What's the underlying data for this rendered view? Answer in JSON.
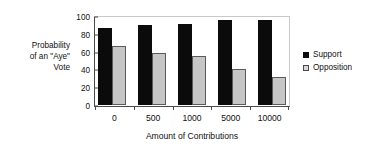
{
  "chart_data": {
    "type": "bar",
    "title": "",
    "categories": [
      "0",
      "500",
      "1000",
      "5000",
      "10000"
    ],
    "series": [
      {
        "name": "Support",
        "values": [
          87,
          90,
          91,
          95,
          96
        ],
        "color": "#0b0b0b"
      },
      {
        "name": "Opposition",
        "values": [
          66,
          59,
          55,
          41,
          31
        ],
        "color": "#c6c6c6"
      }
    ],
    "xlabel": "Amount of Contributions",
    "ylabel": "Probability of an \"Aye\" Vote",
    "ylabel_lines": [
      "Probability",
      "of an \"Aye\"",
      "Vote"
    ],
    "ylim": [
      0,
      100
    ],
    "yticks": [
      0,
      20,
      40,
      60,
      80,
      100
    ],
    "ytick_labels": [
      "0",
      "20",
      "40",
      "60",
      "80",
      "100"
    ],
    "grid": false,
    "legend_position": "right"
  },
  "legend": {
    "entries": [
      {
        "label": "Support"
      },
      {
        "label": "Opposition"
      }
    ]
  },
  "axes": {
    "x_title": "Amount of Contributions",
    "y_title_line1": "Probability",
    "y_title_line2": "of an \"Aye\"",
    "y_title_line3": "Vote"
  }
}
